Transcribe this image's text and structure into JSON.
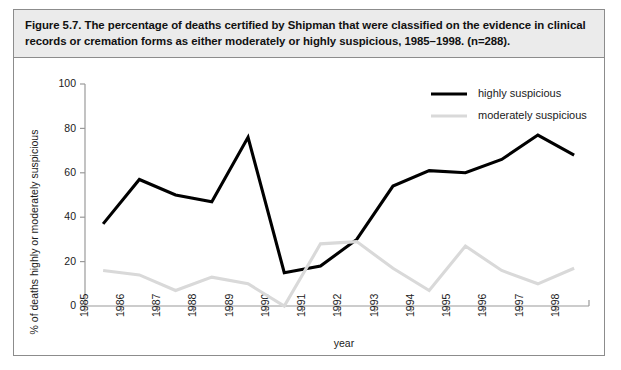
{
  "figure": {
    "caption": "Figure 5.7. The percentage of deaths certified by Shipman that were classified on the evidence in clinical records or cremation forms as either moderately or highly suspicious, 1985–1998. (n=288)."
  },
  "chart_data": {
    "type": "line",
    "title": "",
    "xlabel": "year",
    "ylabel": "% of deaths highly or moderately suspicious",
    "categories": [
      "1985",
      "1986",
      "1987",
      "1988",
      "1989",
      "1990",
      "1991",
      "1992",
      "1993",
      "1994",
      "1995",
      "1996",
      "1997",
      "1998"
    ],
    "xtick_labels": [
      "1985",
      "1986",
      "1987",
      "1988",
      "1989",
      "1990",
      "1991",
      "1992",
      "1993",
      "1994",
      "1995",
      "1996",
      "1997",
      "1998"
    ],
    "ytick_labels": [
      "0",
      "20",
      "40",
      "60",
      "80",
      "100"
    ],
    "ytick_values": [
      0,
      20,
      40,
      60,
      80,
      100
    ],
    "ylim": [
      0,
      100
    ],
    "grid": false,
    "legend_position": "top-right",
    "series": [
      {
        "name": "highly suspicious",
        "color": "#000000",
        "values": [
          37,
          57,
          50,
          47,
          76,
          15,
          18,
          30,
          54,
          61,
          60,
          66,
          77,
          68
        ]
      },
      {
        "name": "moderately suspicious",
        "color": "#d9d9d9",
        "values": [
          16,
          14,
          7,
          13,
          10,
          0,
          28,
          29,
          17,
          7,
          27,
          16,
          10,
          17
        ]
      }
    ]
  }
}
